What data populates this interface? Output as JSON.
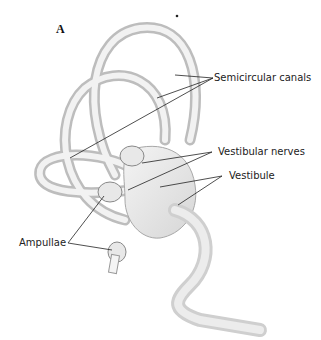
{
  "figure": {
    "panel_letter": "A",
    "labels": {
      "semicircular_canals": "Semicircular canals",
      "vestibular_nerves": "Vestibular nerves",
      "vestibule": "Vestibule",
      "ampullae": "Ampullae"
    }
  }
}
